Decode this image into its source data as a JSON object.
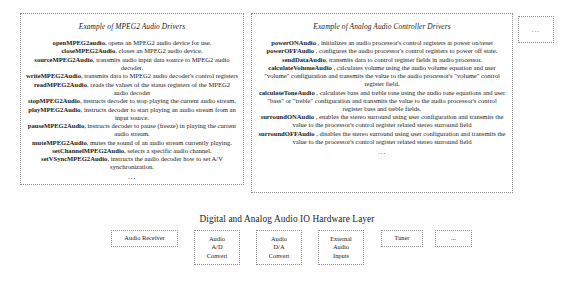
{
  "mpeg_box": {
    "title": "Example of MPEG2 Audio Drivers",
    "entries": [
      {
        "fn": "openMPEG2audio",
        "desc": ", opens an MPEG2 audio device for use."
      },
      {
        "fn": "closeMPEG2Audio",
        "desc": ", closes an MPEG2 audio device."
      },
      {
        "fn": "sourceMPEG2Audio",
        "desc": ", transmits audio input data source to MPEG2 audio decoder."
      },
      {
        "fn": "writeMPEG2Audio",
        "desc": ", transmits data to MPEG2 audio decoder's control registers"
      },
      {
        "fn": "readMPEG2Audio",
        "desc": ", reads the values of the status registers of the MPEG2 audio decoder"
      },
      {
        "fn": "stopMPEG2Audio",
        "desc": ", instructs decoder to stop playing the current audio stream."
      },
      {
        "fn": "playMPEG2Audio",
        "desc": ", instructs decoder to start playing an audio stream from an input source."
      },
      {
        "fn": "pauseMPEG2Audio",
        "desc": ", instructs decoder to pause (freeze) in playing the current audio stream."
      },
      {
        "fn": "muteMPEG2Audio",
        "desc": ", mutes the sound of an audio stream currently playing."
      },
      {
        "fn": "setChannelMPEG2Audio",
        "desc": ", selects a specific audio channel."
      },
      {
        "fn": "setVSyncMPEG2Audio",
        "desc": ", instructs the audio decoder how to set A/V synchronization."
      }
    ],
    "ellipsis": "..."
  },
  "analog_box": {
    "title": "Example of Analog Audio Controller  Drivers",
    "entries": [
      {
        "fn": "powerONAudio",
        "desc": " , initializes an audio processor's control registers  at power on/reset"
      },
      {
        "fn": "powerOFFAudio",
        "desc": " , configures the audio processor's control registers to power off state."
      },
      {
        "fn": "sendDataAudio",
        "desc": ", transmits data to control register fields in audio processor."
      },
      {
        "fn": "calculateVolumeAudio",
        "desc": " , calculates volume using the audio volume equation and user \"volume\" configuration and transmits the value to the audio processor's \"volume\" control register field."
      },
      {
        "fn": "calculateToneAudio",
        "desc": " , calculates bass and treble tone using the audio tone equations and user \"bass\" or \"treble\" configuration and transmits the value to the audio processor's control register bass and treble fields."
      },
      {
        "fn": "surroundONAudio",
        "desc": " , enables the stereo surround using user configuration and transmits the value to the processor's control register related stereo surround field"
      },
      {
        "fn": "surroundOFFAudio",
        "desc": " , disables the stereo surround using user configuration and transmits the value to the processor's control register related stereo surround field"
      }
    ],
    "ellipsis": "..."
  },
  "corner_box": {
    "ellipsis": "..."
  },
  "hardware_layer": {
    "title": "Digital and Analog Audio IO Hardware Layer",
    "boxes": [
      {
        "lines": [
          "Audio Receiver"
        ]
      },
      {
        "lines": [
          "Audio",
          "A/D",
          "Convert"
        ]
      },
      {
        "lines": [
          "Audio",
          "D/A",
          "Convert"
        ]
      },
      {
        "lines": [
          "External",
          "Audio",
          "Inputs"
        ]
      },
      {
        "lines": [
          "Tuner"
        ]
      },
      {
        "lines": [
          "..."
        ]
      }
    ]
  }
}
